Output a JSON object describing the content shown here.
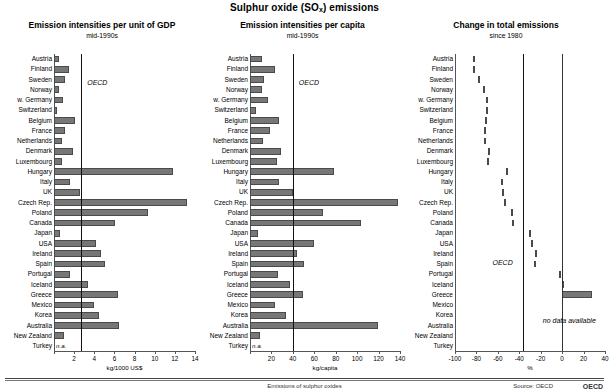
{
  "title": {
    "prefix": "Sulphur oxide (SO",
    "sub": "x",
    "suffix": ") emissions"
  },
  "countries": [
    "Austria",
    "Finland",
    "Sweden",
    "Norway",
    "w. Germany",
    "Switzerland",
    "Belgium",
    "France",
    "Netherlands",
    "Denmark",
    "Luxembourg",
    "Hungary",
    "Italy",
    "UK",
    "Czech Rep.",
    "Poland",
    "Canada",
    "Japan",
    "USA",
    "Ireland",
    "Spain",
    "Portugal",
    "Iceland",
    "Greece",
    "Mexico",
    "Korea",
    "Australia",
    "New Zealand",
    "Turkey"
  ],
  "labels": {
    "oecd": "OECD",
    "na": "n.a.",
    "no_data": "no data available"
  },
  "footer": {
    "center": "Emissions of sulphur oxides",
    "source": "Source: OECD",
    "org": "OECD"
  },
  "chart_data": [
    {
      "type": "bar",
      "title": "Emission intensities per unit of GDP",
      "subtitle": "mid-1990s",
      "xlabel": "kg/1000 US$",
      "ylabel": "",
      "xlim": [
        0,
        14
      ],
      "ticks": [
        0,
        2,
        4,
        6,
        8,
        10,
        12,
        14
      ],
      "grid": false,
      "reference_line": {
        "label": "OECD",
        "value": 2.7
      },
      "categories": [
        "Austria",
        "Finland",
        "Sweden",
        "Norway",
        "w. Germany",
        "Switzerland",
        "Belgium",
        "France",
        "Netherlands",
        "Denmark",
        "Luxembourg",
        "Hungary",
        "Italy",
        "UK",
        "Czech Rep.",
        "Poland",
        "Canada",
        "Japan",
        "USA",
        "Ireland",
        "Spain",
        "Portugal",
        "Iceland",
        "Greece",
        "Mexico",
        "Korea",
        "Australia",
        "New Zealand",
        "Turkey"
      ],
      "values": [
        0.5,
        1.5,
        1.1,
        0.5,
        0.9,
        0.25,
        2.1,
        1.1,
        0.75,
        1.9,
        0.8,
        11.8,
        1.6,
        2.6,
        13.2,
        9.3,
        6.1,
        0.6,
        4.2,
        4.7,
        5.1,
        1.6,
        3.4,
        6.4,
        4.0,
        4.5,
        6.5,
        1.0,
        null
      ],
      "na_categories": [
        "Turkey"
      ]
    },
    {
      "type": "bar",
      "title": "Emission intensities per capita",
      "subtitle": "mid-1990s",
      "xlabel": "kg/capita",
      "ylabel": "",
      "xlim": [
        0,
        140
      ],
      "ticks": [
        0,
        20,
        40,
        60,
        80,
        100,
        120,
        140
      ],
      "grid": false,
      "reference_line": {
        "label": "OECD",
        "value": 40
      },
      "categories": [
        "Austria",
        "Finland",
        "Sweden",
        "Norway",
        "w. Germany",
        "Switzerland",
        "Belgium",
        "France",
        "Netherlands",
        "Denmark",
        "Luxembourg",
        "Hungary",
        "Italy",
        "UK",
        "Czech Rep.",
        "Poland",
        "Canada",
        "Japan",
        "USA",
        "Ireland",
        "Spain",
        "Portugal",
        "Iceland",
        "Greece",
        "Mexico",
        "Korea",
        "Australia",
        "New Zealand",
        "Turkey"
      ],
      "values": [
        11,
        23,
        13,
        11,
        17,
        6,
        27,
        19,
        12,
        29,
        25,
        78,
        27,
        40,
        138,
        68,
        104,
        7,
        60,
        44,
        50,
        26,
        37,
        49,
        23,
        34,
        119,
        9,
        null
      ],
      "na_categories": [
        "Turkey"
      ]
    },
    {
      "type": "bar",
      "title": "Change in total emissions",
      "subtitle": "since 1980",
      "xlabel": "%",
      "ylabel": "",
      "xlim": [
        -100,
        40
      ],
      "ticks": [
        -100,
        -80,
        -60,
        -40,
        -20,
        0,
        20,
        40
      ],
      "grid": false,
      "reference_line": {
        "label": "OECD",
        "value": -37
      },
      "categories": [
        "Austria",
        "Finland",
        "Sweden",
        "Norway",
        "w. Germany",
        "Switzerland",
        "Belgium",
        "France",
        "Netherlands",
        "Denmark",
        "Luxembourg",
        "Hungary",
        "Italy",
        "UK",
        "Czech Rep.",
        "Poland",
        "Canada",
        "Japan",
        "USA",
        "Ireland",
        "Spain",
        "Portugal",
        "Iceland",
        "Greece",
        "Mexico",
        "Korea",
        "Australia",
        "New Zealand",
        "Turkey"
      ],
      "values": [
        -83,
        -83,
        -79,
        -74,
        -71,
        -71,
        -72,
        -73,
        -73,
        -69,
        -70,
        -52,
        -57,
        -56,
        -54,
        -48,
        -47,
        -31,
        -29,
        -25,
        -26,
        -3,
        2,
        28,
        null,
        null,
        null,
        null,
        null
      ],
      "no_data_categories": [
        "Mexico",
        "Korea",
        "Australia",
        "New Zealand",
        "Turkey"
      ]
    }
  ]
}
